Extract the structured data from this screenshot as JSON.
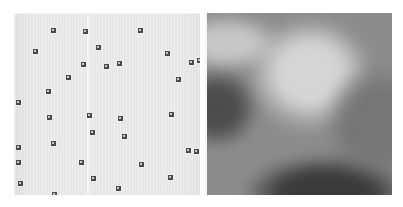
{
  "figure": {
    "title": "",
    "caption": "",
    "background_color": "#ffffff",
    "width": 403,
    "height": 207,
    "panel_count": 2
  },
  "left_panel": {
    "name": "point-pattern-panel",
    "background_color": "#e9e9e9",
    "marker_color": "#4a4a4a",
    "marker_size_px": 5,
    "divider": {
      "orientation": "vertical",
      "x_px": 72,
      "color": "#ffffff"
    },
    "bounds": {
      "x": 14,
      "y": 13,
      "width": 186,
      "height": 182
    },
    "points": [
      [
        38,
        16
      ],
      [
        70,
        17
      ],
      [
        125,
        16
      ],
      [
        196,
        21
      ],
      [
        20,
        37
      ],
      [
        83,
        33
      ],
      [
        152,
        39
      ],
      [
        184,
        46
      ],
      [
        68,
        50
      ],
      [
        53,
        63
      ],
      [
        104,
        49
      ],
      [
        176,
        48
      ],
      [
        33,
        77
      ],
      [
        91,
        52
      ],
      [
        163,
        65
      ],
      [
        3,
        88
      ],
      [
        195,
        66
      ],
      [
        34,
        103
      ],
      [
        74,
        101
      ],
      [
        156,
        100
      ],
      [
        105,
        104
      ],
      [
        77,
        118
      ],
      [
        38,
        129
      ],
      [
        109,
        122
      ],
      [
        3,
        133
      ],
      [
        173,
        136
      ],
      [
        181,
        137
      ],
      [
        3,
        148
      ],
      [
        66,
        148
      ],
      [
        126,
        150
      ],
      [
        78,
        164
      ],
      [
        155,
        163
      ],
      [
        5,
        169
      ],
      [
        39,
        180
      ],
      [
        103,
        174
      ],
      [
        19,
        189
      ],
      [
        102,
        193
      ],
      [
        180,
        192
      ]
    ]
  },
  "right_panel": {
    "name": "grayscale-texture-panel",
    "base_color": "#8d8d8d",
    "bounds": {
      "x": 205,
      "y": 13,
      "width": 187,
      "height": 182
    },
    "description": "blurred grayscale micrograph",
    "features": [
      {
        "name": "dark-ring-structure",
        "cx": 103,
        "cy": 68,
        "rx": 47,
        "ry": 42,
        "tone": "#2e2e2e"
      },
      {
        "name": "bright-center-spot",
        "cx": 94,
        "cy": 65,
        "rx": 7,
        "ry": 6,
        "tone": "#cfcfcf"
      },
      {
        "name": "bright-halo-arc",
        "cx": 103,
        "cy": 62,
        "rx": 62,
        "ry": 57,
        "tone": "#d6d6d6"
      },
      {
        "name": "small-bright-spot-right",
        "cx": 141,
        "cy": 65,
        "rx": 6,
        "ry": 5,
        "tone": "#c6c6c6"
      },
      {
        "name": "dark-region-bottom",
        "cx": 120,
        "cy": 180,
        "rx": 85,
        "ry": 38,
        "tone": "#3a3a3a"
      },
      {
        "name": "bright-band-upper-left",
        "cx": 20,
        "cy": 30,
        "rx": 55,
        "ry": 28,
        "tone": "#c8c8c8"
      },
      {
        "name": "dark-band-left",
        "cx": 10,
        "cy": 95,
        "rx": 42,
        "ry": 40,
        "tone": "#4d4d4d"
      },
      {
        "name": "mid-tone-right",
        "cx": 170,
        "cy": 110,
        "rx": 55,
        "ry": 60,
        "tone": "#767676"
      }
    ]
  }
}
